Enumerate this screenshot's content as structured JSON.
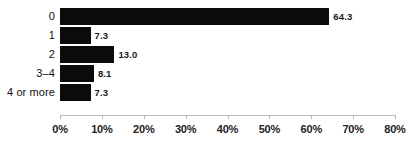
{
  "chart_data": {
    "type": "bar",
    "orientation": "horizontal",
    "title": "",
    "subtitle": "",
    "xlabel": "",
    "ylabel": "",
    "categories": [
      "0",
      "1",
      "2",
      "3–4",
      "4 or more"
    ],
    "values": [
      64.3,
      7.3,
      13.0,
      8.1,
      7.3
    ],
    "value_labels": [
      "64.3",
      "7.3",
      "13.0",
      "8.1",
      "7.3"
    ],
    "xlim": [
      0,
      80
    ],
    "xticks": [
      0,
      10,
      20,
      30,
      40,
      50,
      60,
      70,
      80
    ],
    "xtick_labels": [
      "0%",
      "10%",
      "20%",
      "30%",
      "40%",
      "50%",
      "60%",
      "70%",
      "80%"
    ],
    "grid": false,
    "legend": null,
    "annotations": [],
    "colors": {
      "bar": "#0b0b0b",
      "background": "#ffffff",
      "axis_line": "#b9b9b9",
      "tick_text": "#222222",
      "category_text": "#121212",
      "value_text": "#1a1a1a"
    }
  }
}
